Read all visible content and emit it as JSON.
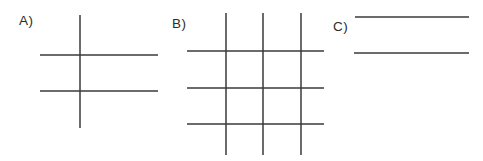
{
  "figure": {
    "background": "#ffffff",
    "line_color": "#3a3a3a",
    "line_width": 1.5,
    "label_color": "#2b2b2b",
    "panels": [
      {
        "id": "a",
        "label": "A)",
        "label_pos": {
          "x": 19,
          "y": 14
        },
        "description": "one vertical line crossing two horizontal lines",
        "lines": [
          {
            "name": "vertical-line",
            "x1": 80,
            "y1": 15,
            "x2": 80,
            "y2": 128
          },
          {
            "name": "horizontal-line-1",
            "x1": 40,
            "y1": 55,
            "x2": 158,
            "y2": 55
          },
          {
            "name": "horizontal-line-2",
            "x1": 40,
            "y1": 91,
            "x2": 158,
            "y2": 91
          }
        ]
      },
      {
        "id": "b",
        "label": "B)",
        "label_pos": {
          "x": 172,
          "y": 17
        },
        "description": "three vertical lines crossing three horizontal lines forming a grid",
        "lines": [
          {
            "name": "vertical-line-1",
            "x1": 226,
            "y1": 13,
            "x2": 226,
            "y2": 155
          },
          {
            "name": "vertical-line-2",
            "x1": 263,
            "y1": 13,
            "x2": 263,
            "y2": 155
          },
          {
            "name": "vertical-line-3",
            "x1": 301,
            "y1": 13,
            "x2": 301,
            "y2": 155
          },
          {
            "name": "horizontal-line-1",
            "x1": 187,
            "y1": 51,
            "x2": 324,
            "y2": 51
          },
          {
            "name": "horizontal-line-2",
            "x1": 187,
            "y1": 88,
            "x2": 324,
            "y2": 88
          },
          {
            "name": "horizontal-line-3",
            "x1": 187,
            "y1": 124,
            "x2": 324,
            "y2": 124
          }
        ]
      },
      {
        "id": "c",
        "label": "C)",
        "label_pos": {
          "x": 333,
          "y": 20
        },
        "description": "two parallel horizontal lines",
        "lines": [
          {
            "name": "horizontal-line-1",
            "x1": 355,
            "y1": 17,
            "x2": 469,
            "y2": 17
          },
          {
            "name": "horizontal-line-2",
            "x1": 354,
            "y1": 53,
            "x2": 469,
            "y2": 53
          }
        ]
      }
    ]
  }
}
